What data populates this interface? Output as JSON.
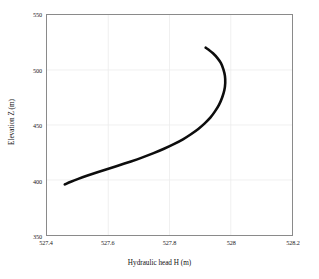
{
  "chart_data": {
    "type": "line",
    "title": "",
    "xlabel": "Hydraulic head H (m)",
    "ylabel": "Elevation Z (m)",
    "xlim": [
      527.4,
      528.2
    ],
    "ylim": [
      350,
      550
    ],
    "xticks": [
      "527.4",
      "527.6",
      "527.8",
      "528",
      "528.2"
    ],
    "xtick_values": [
      527.4,
      527.6,
      527.8,
      528.0,
      528.2
    ],
    "yticks": [
      "350",
      "400",
      "450",
      "500",
      "550"
    ],
    "ytick_values": [
      350,
      400,
      450,
      500,
      550
    ],
    "grid": true,
    "legend": "none",
    "series": [
      {
        "name": "Hydraulic head profile",
        "color": "#0d0d0d",
        "line_width": 2.6,
        "x": [
          527.458,
          527.478,
          527.502,
          527.53,
          527.562,
          527.598,
          527.636,
          527.674,
          527.712,
          527.748,
          527.782,
          527.814,
          527.844,
          527.87,
          527.894,
          527.915,
          527.934,
          527.949,
          527.962,
          527.972,
          527.979,
          527.982,
          527.981,
          527.976,
          527.968,
          527.956,
          527.942,
          527.928,
          527.918
        ],
        "y": [
          396.0,
          398.4,
          401.0,
          403.8,
          406.8,
          410.0,
          413.4,
          416.9,
          420.6,
          424.4,
          428.4,
          432.6,
          437.0,
          441.6,
          446.4,
          451.5,
          456.9,
          462.6,
          468.6,
          475.0,
          481.6,
          488.2,
          494.6,
          500.6,
          506.2,
          511.0,
          515.2,
          518.4,
          520.3
        ]
      }
    ]
  },
  "axes": {
    "x_title": "Hydraulic head H (m)",
    "y_title": "Elevation Z (m)"
  }
}
